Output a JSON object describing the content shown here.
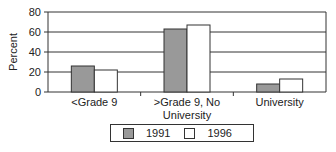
{
  "chart_data": {
    "type": "bar",
    "title": "",
    "xlabel": "",
    "ylabel": "Percent",
    "ylim": [
      0,
      80
    ],
    "yticks": [
      0,
      20,
      40,
      60,
      80
    ],
    "grid": true,
    "legend_position": "bottom",
    "categories": [
      "<Grade 9",
      ">Grade 9, No University",
      "University"
    ],
    "category_labels": [
      [
        "<Grade 9"
      ],
      [
        ">Grade 9, No",
        "University"
      ],
      [
        "University"
      ]
    ],
    "series": [
      {
        "name": "1991",
        "values": [
          26,
          63,
          8
        ],
        "color": "#999999"
      },
      {
        "name": "1996",
        "values": [
          22,
          67,
          13
        ],
        "color": "#ffffff"
      }
    ]
  }
}
